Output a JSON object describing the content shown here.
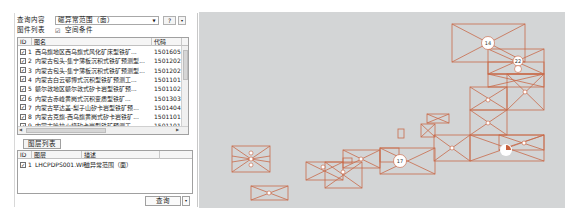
{
  "query_panel": {
    "query_content_label": "查询内容",
    "query_content_value": "磁异常范围（面）",
    "help_button": "?",
    "more_button": "▾",
    "map_list_label": "图件列表",
    "spatial_condition_label": "空间条件",
    "spatial_condition_checked": true
  },
  "map_table": {
    "columns": [
      "ID",
      "图名",
      "代码"
    ],
    "rows": [
      {
        "id": "1",
        "name": "西乌旗地区西乌旗式风化矿床型铁矿...",
        "code": "1501605",
        "checked": true
      },
      {
        "id": "2",
        "name": "内蒙古包头-集宁薄板沉积式铁矿预测型...",
        "code": "1501202",
        "checked": true
      },
      {
        "id": "3",
        "name": "内蒙古包头-集宁薄板沉积式铁矿预测型...",
        "code": "1501202",
        "checked": true
      },
      {
        "id": "4",
        "name": "内蒙古白云鄂博式沉积型铁矿预测工...",
        "code": "1501101",
        "checked": true
      },
      {
        "id": "5",
        "name": "额尔敦地区额尔敦式矽卡岩型铁矿预...",
        "code": "1501102",
        "checked": true
      },
      {
        "id": "6",
        "name": "内蒙古赤峰黄岗式沉积变质型铁矿...",
        "code": "1501303",
        "checked": true
      },
      {
        "id": "7",
        "name": "内蒙古罕达盖-梨子山矽卡岩型铁矿预...",
        "code": "1501404",
        "checked": true
      },
      {
        "id": "8",
        "name": "内蒙古克旗-西乌旗黄岗式矽卡岩铁矿...",
        "code": "1501101",
        "checked": true
      },
      {
        "id": "9",
        "name": "内蒙古哈拉火烧矽卡岩型铁矿预测工...",
        "code": "1501101",
        "checked": true
      }
    ]
  },
  "layer_tab": {
    "label": "图层列表"
  },
  "layer_table": {
    "columns": [
      "ID",
      "图层",
      "描述"
    ],
    "rows": [
      {
        "id": "1",
        "layer": "LHCPDPS001.WP",
        "desc": "磁异常范围（面）",
        "checked": true
      }
    ]
  },
  "query_button": {
    "label": "查询",
    "more": "▾"
  },
  "map_view": {
    "background": "#d3d5d6",
    "stroke_color": "#c8603c",
    "cluster_labels": [
      "14",
      "22",
      "17"
    ]
  }
}
